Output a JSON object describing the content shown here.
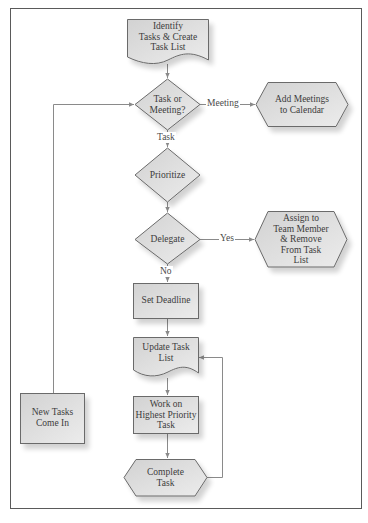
{
  "diagram": {
    "type": "flowchart",
    "title": "",
    "colors": {
      "shape_fill_top": "#d6d6d6",
      "shape_fill_bottom": "#ebebeb",
      "shape_stroke": "#6a6a6a",
      "connector": "#8a8a8a",
      "text": "#3c3c3c",
      "frame": "#5a5a5a"
    },
    "nodes": {
      "identify": {
        "shape": "document",
        "lines": [
          "Identify",
          "Tasks & Create",
          "Task List"
        ]
      },
      "task_or_meeting": {
        "shape": "decision",
        "lines": [
          "Task or",
          "Meeting?"
        ]
      },
      "add_meetings": {
        "shape": "hexagon",
        "lines": [
          "Add Meetings",
          "to Calendar"
        ]
      },
      "prioritize": {
        "shape": "decision",
        "lines": [
          "Prioritize"
        ]
      },
      "delegate": {
        "shape": "decision",
        "lines": [
          "Delegate"
        ]
      },
      "assign": {
        "shape": "hexagon",
        "lines": [
          "Assign to",
          "Team Member",
          "& Remove",
          "From Task",
          "List"
        ]
      },
      "set_deadline": {
        "shape": "process",
        "lines": [
          "Set Deadline"
        ]
      },
      "update_task_list": {
        "shape": "document",
        "lines": [
          "Update Task",
          "List"
        ]
      },
      "work_on": {
        "shape": "process",
        "lines": [
          "Work on",
          "Highest Priority",
          "Task"
        ]
      },
      "complete_task": {
        "shape": "hexagon",
        "lines": [
          "Complete",
          "Task"
        ]
      },
      "new_tasks": {
        "shape": "process",
        "lines": [
          "New Tasks",
          "Come In"
        ]
      }
    },
    "edges": [
      {
        "from": "identify",
        "to": "task_or_meeting",
        "label": ""
      },
      {
        "from": "task_or_meeting",
        "to": "add_meetings",
        "label": "Meeting"
      },
      {
        "from": "task_or_meeting",
        "to": "prioritize",
        "label": "Task"
      },
      {
        "from": "prioritize",
        "to": "delegate",
        "label": ""
      },
      {
        "from": "delegate",
        "to": "assign",
        "label": "Yes"
      },
      {
        "from": "delegate",
        "to": "set_deadline",
        "label": "No"
      },
      {
        "from": "set_deadline",
        "to": "update_task_list",
        "label": ""
      },
      {
        "from": "update_task_list",
        "to": "work_on",
        "label": ""
      },
      {
        "from": "work_on",
        "to": "complete_task",
        "label": ""
      },
      {
        "from": "complete_task",
        "to": "update_task_list",
        "label": ""
      },
      {
        "from": "new_tasks",
        "to": "task_or_meeting",
        "label": ""
      }
    ],
    "edge_labels": {
      "meeting": "Meeting",
      "task": "Task",
      "yes": "Yes",
      "no": "No"
    }
  }
}
